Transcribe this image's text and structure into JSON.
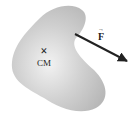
{
  "diagram": {
    "body": {
      "label": "CM",
      "marker": "×",
      "fill": "#c8c8c8"
    },
    "force": {
      "label": "F",
      "vector_mark": "→",
      "color": "#222222"
    }
  }
}
